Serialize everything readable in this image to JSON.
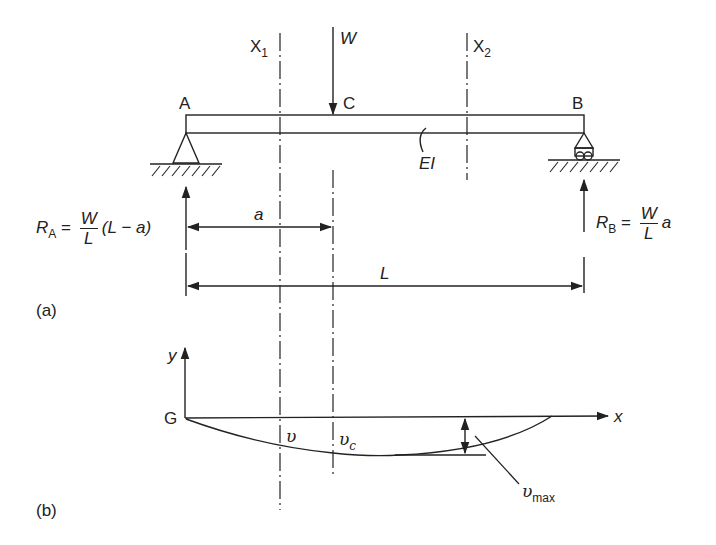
{
  "diagram": {
    "type": "simply-supported-beam-deflection",
    "panel_a": {
      "caption": "(a)",
      "section_lines": [
        {
          "letter": "X",
          "sub": "1"
        },
        {
          "letter": "X",
          "sub": "2"
        }
      ],
      "load": {
        "label": "W"
      },
      "points": {
        "left": "A",
        "load": "C",
        "right": "B"
      },
      "stiffness": "EI",
      "reaction_a": {
        "R": "R",
        "sub": "A",
        "eq": "=",
        "num": "W",
        "den": "L",
        "tail": "(L − a)"
      },
      "reaction_b": {
        "R": "R",
        "sub": "B",
        "eq": "=",
        "num": "W",
        "den": "L",
        "tail": "a"
      },
      "dimension_a": "a",
      "dimension_L": "L"
    },
    "panel_b": {
      "caption": "(b)",
      "origin": "G",
      "x_axis": "x",
      "y_axis": "y",
      "deflection_at_section": "υ",
      "deflection_at_load": {
        "base": "υ",
        "sub": "c"
      },
      "max_deflection": {
        "base": "υ",
        "sub": "max"
      }
    },
    "colors": {
      "line": "#222222",
      "background": "#ffffff"
    }
  }
}
